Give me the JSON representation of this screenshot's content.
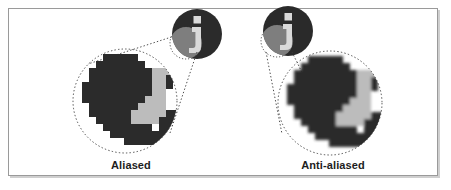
{
  "figure": {
    "background_color": "#ffffff",
    "frame_color": "#9a9a9a"
  },
  "palette": {
    "dark": "#2b2b2b",
    "mid_gray": "#8d8d8d",
    "light_gray": "#bcbcbc",
    "paper": "#ffffff",
    "dotted": "#3a3a3a"
  },
  "panels": [
    {
      "id": "aliased",
      "caption": "Aliased",
      "icon_name": "info-icon",
      "magnifier_note": "hard stair-stepped pixel edges"
    },
    {
      "id": "anti-aliased",
      "caption": "Anti-aliased",
      "icon_name": "info-icon",
      "magnifier_note": "smooth blended pixel edges"
    }
  ]
}
